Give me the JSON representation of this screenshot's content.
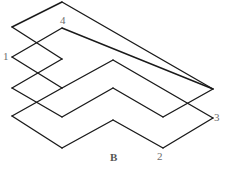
{
  "figure": {
    "caption": "B",
    "caption_position": {
      "x": 110,
      "y": 152
    },
    "stroke_color": "#1a1a1a",
    "stroke_width": 1.4,
    "fill_color": "none",
    "background_color": "#ffffff",
    "label_color": "#6d6d6d",
    "caption_color": "#555555",
    "width": 228,
    "height": 169
  },
  "vertex_labels": [
    {
      "id": "label-1",
      "text": "1",
      "x": 3,
      "y": 51
    },
    {
      "id": "label-2",
      "text": "2",
      "x": 157,
      "y": 151
    },
    {
      "id": "label-3",
      "text": "3",
      "x": 214,
      "y": 112
    },
    {
      "id": "label-4",
      "text": "4",
      "x": 60,
      "y": 15
    }
  ],
  "paths": {
    "outer_outline": "M 62 2 L 12 27 L 62 59 L 12 88 L 62 117 L 12 116 L 62 148 L 113 120 L 163 148 L 213 118 L 113 60 L 163 32 L 213 89 Z",
    "outline_points": [
      {
        "name": "top-apex",
        "x": 62,
        "y": 2
      },
      {
        "name": "left-upper-notch",
        "x": 12,
        "y": 27
      },
      {
        "name": "mid-upper-right",
        "x": 62,
        "y": 59
      },
      {
        "name": "left-mid-notch",
        "x": 12,
        "y": 88
      },
      {
        "name": "mid-lower-right",
        "x": 62,
        "y": 117
      },
      {
        "name": "left-lower-notch",
        "x": 12,
        "y": 116
      },
      {
        "name": "bottom-left-apex",
        "x": 62,
        "y": 148
      },
      {
        "name": "bottom-mid-peak",
        "x": 113,
        "y": 120
      },
      {
        "name": "bottom-apex-2",
        "x": 163,
        "y": 148
      },
      {
        "name": "right-apex-3",
        "x": 213,
        "y": 118
      },
      {
        "name": "inner-mid-joint",
        "x": 113,
        "y": 60
      },
      {
        "name": "vertex-4-corner",
        "x": 62,
        "y": 28
      },
      {
        "name": "right-outer-apex",
        "x": 213,
        "y": 89
      }
    ],
    "segments": [
      {
        "name": "seg-top-left",
        "x1": 62,
        "y1": 2,
        "x2": 12,
        "y2": 27
      },
      {
        "name": "seg-left-up-in",
        "x1": 12,
        "y1": 27,
        "x2": 62,
        "y2": 59
      },
      {
        "name": "seg-left-down-1",
        "x1": 62,
        "y1": 59,
        "x2": 12,
        "y2": 88
      },
      {
        "name": "seg-left-up-2",
        "x1": 12,
        "y1": 88,
        "x2": 62,
        "y2": 117
      },
      {
        "name": "seg-inner-v4-left",
        "x1": 62,
        "y1": 28,
        "x2": 12,
        "y2": 57
      },
      {
        "name": "seg-inner-v1-right",
        "x1": 12,
        "y1": 57,
        "x2": 62,
        "y2": 88
      },
      {
        "name": "seg-inner-down-2",
        "x1": 62,
        "y1": 88,
        "x2": 12,
        "y2": 116
      },
      {
        "name": "seg-bottom-left-up",
        "x1": 12,
        "y1": 116,
        "x2": 62,
        "y2": 148
      },
      {
        "name": "seg-bottom-to-peak",
        "x1": 62,
        "y1": 148,
        "x2": 113,
        "y2": 120
      },
      {
        "name": "seg-peak-to-2",
        "x1": 113,
        "y1": 120,
        "x2": 163,
        "y2": 148
      },
      {
        "name": "seg-2-to-3",
        "x1": 163,
        "y1": 148,
        "x2": 213,
        "y2": 118
      },
      {
        "name": "seg-3-to-mid",
        "x1": 213,
        "y1": 118,
        "x2": 113,
        "y2": 60
      },
      {
        "name": "seg-mid-to-v4",
        "x1": 113,
        "y1": 60,
        "x2": 62,
        "y2": 88
      },
      {
        "name": "seg-inner-top-right",
        "x1": 62,
        "y1": 28,
        "x2": 213,
        "y2": 89
      },
      {
        "name": "seg-top-right",
        "x1": 62,
        "y1": 2,
        "x2": 213,
        "y2": 89
      },
      {
        "name": "seg-mid-arm-lower",
        "x1": 62,
        "y1": 117,
        "x2": 113,
        "y2": 88
      },
      {
        "name": "seg-arm-peak-right",
        "x1": 113,
        "y1": 88,
        "x2": 163,
        "y2": 117
      },
      {
        "name": "seg-arm-right-up",
        "x1": 163,
        "y1": 117,
        "x2": 213,
        "y2": 89
      }
    ]
  }
}
